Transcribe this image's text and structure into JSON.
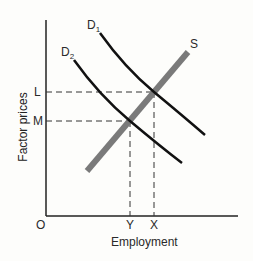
{
  "diagram": {
    "type": "factor market supply and demand",
    "y_axis_label": "Factor prices",
    "x_axis_label": "Employment",
    "origin_label": "O",
    "price_levels": [
      {
        "label": "L"
      },
      {
        "label": "M"
      }
    ],
    "employment_levels": [
      {
        "label": "Y"
      },
      {
        "label": "X"
      }
    ],
    "curves": {
      "d1": {
        "label": "D",
        "sub": "1"
      },
      "d2": {
        "label": "D",
        "sub": "2"
      },
      "s": {
        "label": "S"
      }
    },
    "colors": {
      "demand": "#111111",
      "supply": "#7a7a7a",
      "axes": "#222222"
    }
  }
}
